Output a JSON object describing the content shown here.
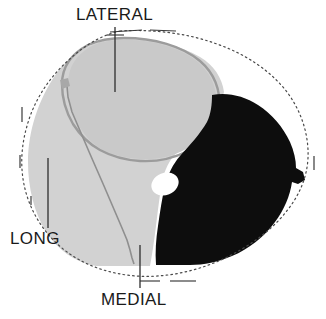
{
  "figure": {
    "labels": [
      {
        "id": "lateral",
        "text": "LATERAL",
        "position": "top"
      },
      {
        "id": "long",
        "text": "LONG",
        "position": "bottom-left"
      },
      {
        "id": "medial",
        "text": "MEDIAL",
        "position": "bottom-center"
      }
    ],
    "regions": [
      {
        "id": "outer-boundary",
        "name": "outer-contour",
        "style": "dashed-dotted-outline",
        "color": "#555555"
      },
      {
        "id": "light-region",
        "name": "light-gray-region",
        "color": "#d2d2d2"
      },
      {
        "id": "circle-region",
        "name": "upper-circular-region",
        "color": "#cccccc",
        "outline_color": "#9a9a9a"
      },
      {
        "id": "dark-region",
        "name": "black-region",
        "color": "#0d0d0d"
      },
      {
        "id": "white-oval",
        "name": "white-oval-inclusion",
        "color": "#ffffff"
      },
      {
        "id": "septum-line",
        "name": "internal-septum-line",
        "color": "#8a8a8a"
      }
    ],
    "leader_lines": [
      {
        "id": "lateral-leader",
        "x1": 115,
        "y1": 27,
        "x2": 115,
        "y2": 92
      },
      {
        "id": "long-leader",
        "x1": 48,
        "y1": 158,
        "x2": 48,
        "y2": 228
      },
      {
        "id": "medial-leader",
        "x1": 140,
        "y1": 245,
        "x2": 140,
        "y2": 288
      }
    ],
    "colors": {
      "background": "#ffffff",
      "light_gray": "#d2d2d2",
      "mid_gray": "#cccccc",
      "outline_gray": "#9a9a9a",
      "black": "#0d0d0d",
      "text": "#1a1a1a",
      "leader": "#3a3a3a"
    }
  }
}
